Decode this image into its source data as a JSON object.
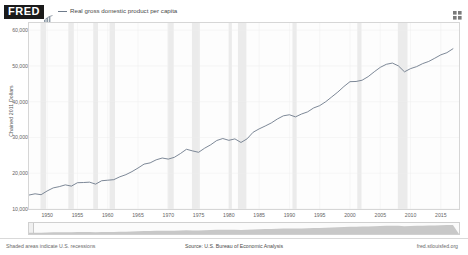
{
  "header": {
    "logo_text": "FRED",
    "logo_icon": "mini-chart-icon",
    "expand_icon": "expand-fullscreen-icon",
    "legend": [
      {
        "label": "Real gross domestic product per capita",
        "color": "#6e7b8b"
      }
    ]
  },
  "footer": {
    "recession_note": "Shaded areas indicate U.S. recessions",
    "source": "Source: U.S. Bureau of Economic Analysis",
    "url": "fred.stlouisfed.org"
  },
  "range_selector": {
    "handle_name": "range-left-handle"
  },
  "chart_data": {
    "type": "line",
    "title": "",
    "subtitle": "",
    "xlabel": "",
    "ylabel": "Chained 2011 Dollars",
    "xlim": [
      1947,
      2018
    ],
    "ylim": [
      10000,
      62000
    ],
    "grid": true,
    "legend_position": "top-left",
    "y_ticks": [
      {
        "value": 60000,
        "label": "60,000"
      },
      {
        "value": 50000,
        "label": "50,000"
      },
      {
        "value": 40000,
        "label": "40,000"
      },
      {
        "value": 30000,
        "label": "30,000"
      },
      {
        "value": 20000,
        "label": "20,000"
      },
      {
        "value": 10000,
        "label": "10,000"
      }
    ],
    "x_ticks": [
      {
        "value": 1950,
        "label": "1950"
      },
      {
        "value": 1955,
        "label": "1955"
      },
      {
        "value": 1960,
        "label": "1960"
      },
      {
        "value": 1965,
        "label": "1965"
      },
      {
        "value": 1970,
        "label": "1970"
      },
      {
        "value": 1975,
        "label": "1975"
      },
      {
        "value": 1980,
        "label": "1980"
      },
      {
        "value": 1985,
        "label": "1985"
      },
      {
        "value": 1990,
        "label": "1990"
      },
      {
        "value": 1995,
        "label": "1995"
      },
      {
        "value": 2000,
        "label": "2000"
      },
      {
        "value": 2005,
        "label": "2005"
      },
      {
        "value": 2010,
        "label": "2010"
      },
      {
        "value": 2015,
        "label": "2015"
      }
    ],
    "recession_bands": [
      [
        1948.9,
        1949.8
      ],
      [
        1953.5,
        1954.4
      ],
      [
        1957.6,
        1958.4
      ],
      [
        1960.3,
        1961.2
      ],
      [
        1969.9,
        1970.9
      ],
      [
        1973.9,
        1975.2
      ],
      [
        1980.0,
        1980.5
      ],
      [
        1981.5,
        1982.9
      ],
      [
        1990.5,
        1991.2
      ],
      [
        2001.2,
        2001.9
      ],
      [
        2007.9,
        2009.5
      ]
    ],
    "series": [
      {
        "name": "Real gross domestic product per capita",
        "color": "#6e7b8b",
        "x": [
          1947,
          1948,
          1949,
          1950,
          1951,
          1952,
          1953,
          1954,
          1955,
          1956,
          1957,
          1958,
          1959,
          1960,
          1961,
          1962,
          1963,
          1964,
          1965,
          1966,
          1967,
          1968,
          1969,
          1970,
          1971,
          1972,
          1973,
          1974,
          1975,
          1976,
          1977,
          1978,
          1979,
          1980,
          1981,
          1982,
          1983,
          1984,
          1985,
          1986,
          1987,
          1988,
          1989,
          1990,
          1991,
          1992,
          1993,
          1994,
          1995,
          1996,
          1997,
          1998,
          1999,
          2000,
          2001,
          2002,
          2003,
          2004,
          2005,
          2006,
          2007,
          2008,
          2009,
          2010,
          2011,
          2012,
          2013,
          2014,
          2015,
          2016,
          2017
        ],
        "values": [
          13900,
          14250,
          14000,
          15050,
          15900,
          16250,
          16750,
          16400,
          17350,
          17400,
          17500,
          16950,
          17900,
          18050,
          18200,
          19000,
          19600,
          20450,
          21450,
          22550,
          22900,
          23750,
          24250,
          23950,
          24450,
          25500,
          26700,
          26250,
          25850,
          27000,
          27950,
          29150,
          29700,
          29200,
          29600,
          28600,
          29600,
          31450,
          32400,
          33200,
          34050,
          35150,
          36050,
          36350,
          35750,
          36550,
          37150,
          38250,
          38900,
          40000,
          41350,
          42700,
          44250,
          45600,
          45650,
          46000,
          47000,
          48350,
          49600,
          50450,
          50800,
          50000,
          48350,
          49250,
          49800,
          50650,
          51250,
          52150,
          53100,
          53700,
          54800
        ]
      }
    ]
  }
}
